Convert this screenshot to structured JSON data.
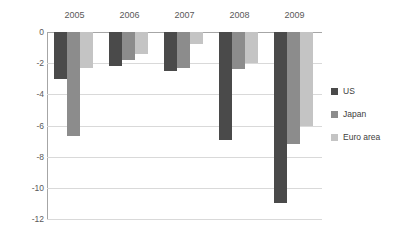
{
  "chart_data": {
    "type": "bar",
    "title": "",
    "subtitle": "",
    "xlabel": "",
    "ylabel": "",
    "categories": [
      "2005",
      "2006",
      "2007",
      "2008",
      "2009"
    ],
    "series": [
      {
        "name": "US",
        "color": "#4a4a4a",
        "values": [
          -3.0,
          -2.2,
          -2.5,
          -6.9,
          -11.0
        ]
      },
      {
        "name": "Japan",
        "color": "#8c8c8c",
        "values": [
          -6.7,
          -1.8,
          -2.3,
          -2.4,
          -7.2
        ]
      },
      {
        "name": "Euro area",
        "color": "#c4c4c4",
        "values": [
          -2.3,
          -1.4,
          -0.8,
          -2.0,
          -6.0
        ]
      }
    ],
    "ylim": [
      -12,
      0
    ],
    "ytick_values": [
      0,
      -2,
      -4,
      -6,
      -8,
      -10,
      -12
    ],
    "ytick_labels": [
      "0",
      "-2",
      "-4",
      "-6",
      "-8",
      "-10",
      "-12"
    ],
    "grid": true,
    "grid_axis": "y",
    "legend_position": "right",
    "xaxis_position": "top",
    "annotations": []
  },
  "legend": {
    "items": [
      {
        "label": "US"
      },
      {
        "label": "Japan"
      },
      {
        "label": "Euro area"
      }
    ]
  },
  "colors": {
    "series_us": "#4a4a4a",
    "series_japan": "#8c8c8c",
    "series_euro": "#c4c4c4",
    "gridline": "#d9d9d9",
    "axis": "#a6a6a6",
    "text": "#595959",
    "background": "#ffffff"
  }
}
